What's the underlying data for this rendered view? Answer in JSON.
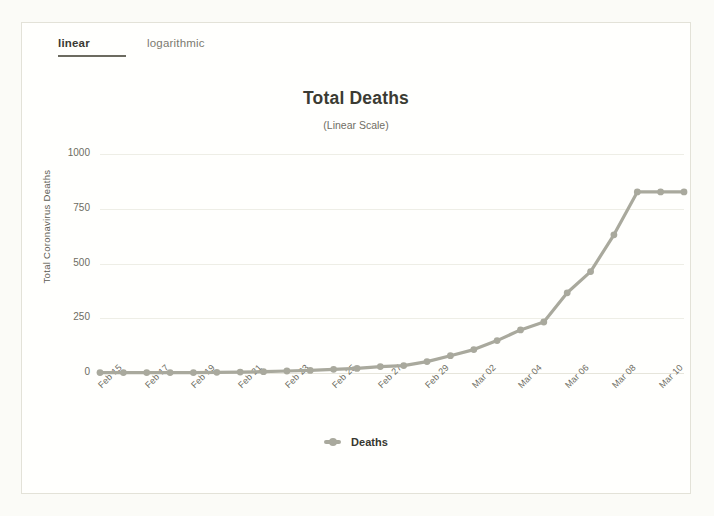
{
  "tabs": [
    {
      "id": "linear",
      "label": "linear",
      "active": true
    },
    {
      "id": "logarithmic",
      "label": "logarithmic",
      "active": false
    }
  ],
  "colors": {
    "series": "#a9a99d",
    "grid": "#eeeee6",
    "text": "#3b3b33",
    "muted": "#6d6c62",
    "card_bg": "#fffffd",
    "page_bg": "#fbfbf7",
    "tab_underline": "#6c6b60"
  },
  "legend": {
    "position": "bottom",
    "items": [
      {
        "label": "Deaths",
        "color": "#a9a99d"
      }
    ]
  },
  "chart_data": {
    "type": "line",
    "title": "Total Deaths",
    "subtitle": "(Linear Scale)",
    "xlabel": "",
    "ylabel": "Total Coronavirus Deaths",
    "ylim": [
      0,
      1000
    ],
    "yticks": [
      0,
      250,
      500,
      750,
      1000
    ],
    "ytick_labels": [
      "0",
      "250",
      "500",
      "750",
      "1000"
    ],
    "grid": true,
    "legend_position": "bottom",
    "x": [
      "Feb 15",
      "Feb 16",
      "Feb 17",
      "Feb 18",
      "Feb 19",
      "Feb 20",
      "Feb 21",
      "Feb 22",
      "Feb 23",
      "Feb 24",
      "Feb 25",
      "Feb 26",
      "Feb 27",
      "Feb 28",
      "Feb 29",
      "Mar 01",
      "Mar 02",
      "Mar 03",
      "Mar 04",
      "Mar 05",
      "Mar 06",
      "Mar 07",
      "Mar 08",
      "Mar 09",
      "Mar 10",
      "Mar 11"
    ],
    "xtick_labels": [
      "Feb 15",
      "Feb 17",
      "Feb 19",
      "Feb 21",
      "Feb 23",
      "Feb 25",
      "Feb 27",
      "Feb 29",
      "Mar 02",
      "Mar 04",
      "Mar 06",
      "Mar 08",
      "Mar 10"
    ],
    "series": [
      {
        "name": "Deaths",
        "color": "#a9a99d",
        "values": [
          2,
          2,
          2,
          2,
          2,
          3,
          4,
          6,
          9,
          12,
          17,
          21,
          29,
          34,
          52,
          79,
          107,
          148,
          197,
          233,
          366,
          463,
          631,
          827,
          827,
          827
        ]
      }
    ]
  }
}
